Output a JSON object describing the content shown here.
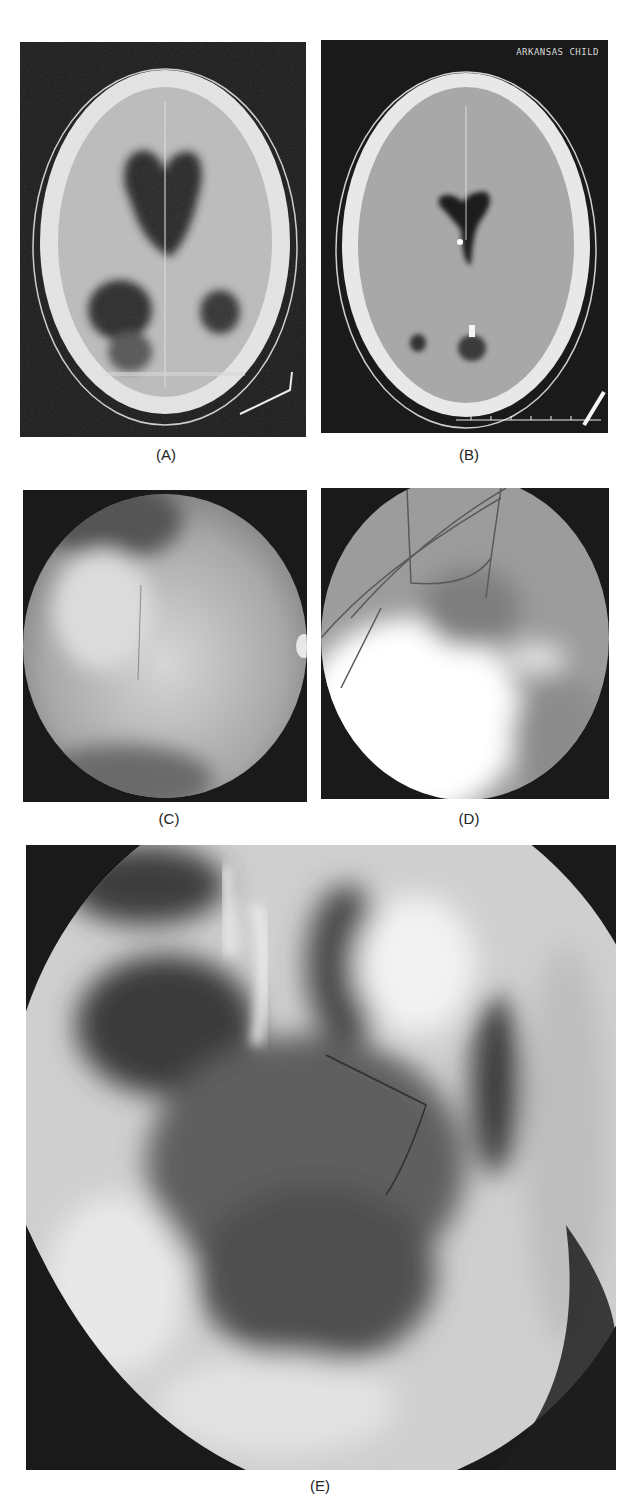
{
  "figure": {
    "panels": [
      {
        "id": "A",
        "label": "(A)",
        "description": "Axial CT scan of brain showing large dark cystic regions (dilated ventricles/cysts)"
      },
      {
        "id": "B",
        "label": "(B)",
        "description": "Axial CT scan of brain with small ventricles, post-treatment",
        "overlay_text": "ARKANSAS CHILD"
      },
      {
        "id": "C",
        "label": "(C)",
        "description": "Circular endoscopic view, hazy grey cyst wall"
      },
      {
        "id": "D",
        "label": "(D)",
        "description": "Circular endoscopic view with blood vessels and bright region"
      },
      {
        "id": "E",
        "label": "(E)",
        "description": "Large endoscopic view of intraventricular anatomy with fenestration"
      }
    ]
  },
  "colors": {
    "background": "#ffffff",
    "panel_bg": "#1a1a1a",
    "skull": "#e8e8e8",
    "brain": "#b5b5b5",
    "cyst": "#2a2a2a",
    "label_text": "#222222"
  }
}
